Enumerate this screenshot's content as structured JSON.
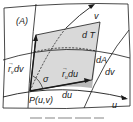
{
  "figure": {
    "panel_label": "(A)",
    "labels": {
      "tangent_plane": "d T",
      "surface_area": "dA",
      "v_axis": "v",
      "u_axis": "u",
      "rv_vector": "r",
      "rv_sub": "v",
      "rv_suffix": " dv",
      "ru_vector": "r",
      "ru_sub": "u",
      "ru_suffix": " du",
      "angle": "σ",
      "point": "P(u,v)",
      "du": "du",
      "dv": "dv"
    },
    "caption": "",
    "colors": {
      "tangent_plane_fill": "#d9d9d9",
      "surface_area_fill": "#b9b9b9",
      "stroke": "#1a1a1a",
      "background": "#ffffff"
    }
  }
}
